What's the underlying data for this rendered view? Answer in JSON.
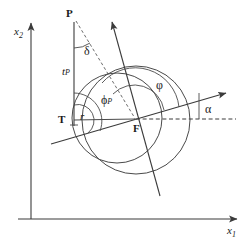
{
  "figure": {
    "type": "geometric-diagram",
    "background_color": "#ffffff",
    "stroke_color": "#3b3b3b",
    "axis_color": "#3b3b3b",
    "labels": {
      "axis_x1": "x",
      "axis_x1_sub": "1",
      "axis_x2": "x",
      "axis_x2_sub": "2",
      "point_p": "P",
      "point_t": "T",
      "point_f": "F",
      "angle_delta": "δ",
      "angle_phi_p": "ϕ",
      "angle_phi_p_sub": "P",
      "angle_phi": "φ",
      "angle_alpha": "α",
      "length_t_p": "t",
      "length_t_p_sub": "P",
      "length_r": "r"
    },
    "geometry": {
      "origin": {
        "x": 31,
        "y": 219
      },
      "point_p": {
        "x": 74,
        "y": 20
      },
      "point_t": {
        "x": 74,
        "y": 122
      },
      "point_f": {
        "x": 134,
        "y": 120
      },
      "big_circle": {
        "cx": 136,
        "cy": 120,
        "r": 54
      },
      "small_circle": {
        "cx": 118,
        "cy": 118,
        "r": 45
      },
      "alpha_degrees": 13,
      "phi_degrees": 103,
      "phi_p_degrees": 77,
      "delta_degrees": 17
    }
  }
}
